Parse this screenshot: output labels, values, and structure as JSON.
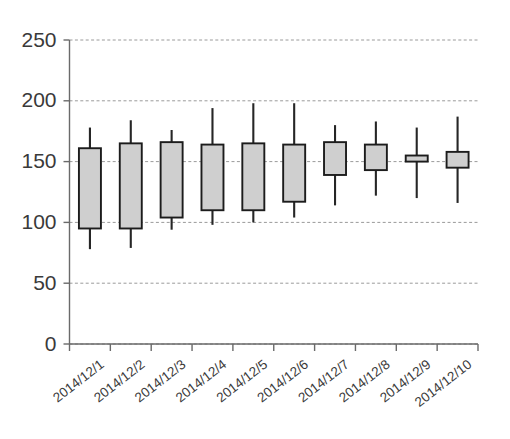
{
  "chart_data": {
    "type": "box",
    "title": "",
    "xlabel": "",
    "ylabel": "",
    "ylim": [
      0,
      250
    ],
    "yticks": [
      0,
      50,
      100,
      150,
      200,
      250
    ],
    "grid": true,
    "legend": null,
    "categories": [
      "2014/12/1",
      "2014/12/2",
      "2014/12/3",
      "2014/12/4",
      "2014/12/5",
      "2014/12/6",
      "2014/12/7",
      "2014/12/8",
      "2014/12/9",
      "2014/12/10"
    ],
    "boxes": [
      {
        "category": "2014/12/1",
        "low": 78,
        "q1": 95,
        "q3": 161,
        "high": 178
      },
      {
        "category": "2014/12/2",
        "low": 79,
        "q1": 95,
        "q3": 165,
        "high": 184
      },
      {
        "category": "2014/12/3",
        "low": 94,
        "q1": 104,
        "q3": 166,
        "high": 176
      },
      {
        "category": "2014/12/4",
        "low": 98,
        "q1": 110,
        "q3": 164,
        "high": 194
      },
      {
        "category": "2014/12/5",
        "low": 100,
        "q1": 110,
        "q3": 165,
        "high": 198
      },
      {
        "category": "2014/12/6",
        "low": 104,
        "q1": 117,
        "q3": 164,
        "high": 198
      },
      {
        "category": "2014/12/7",
        "low": 114,
        "q1": 139,
        "q3": 166,
        "high": 180
      },
      {
        "category": "2014/12/8",
        "low": 122,
        "q1": 143,
        "q3": 164,
        "high": 183
      },
      {
        "category": "2014/12/9",
        "low": 120,
        "q1": 150,
        "q3": 155,
        "high": 178
      },
      {
        "category": "2014/12/10",
        "low": 116,
        "q1": 145,
        "q3": 158,
        "high": 187
      }
    ],
    "colors": {
      "box_fill": "#cfcfcf",
      "box_stroke": "#1c1c1c",
      "whisker": "#262626",
      "grid": "#9a9a9a",
      "axis": "#6a6a6a",
      "text": "#3a3a3a",
      "background": "#ffffff"
    }
  }
}
